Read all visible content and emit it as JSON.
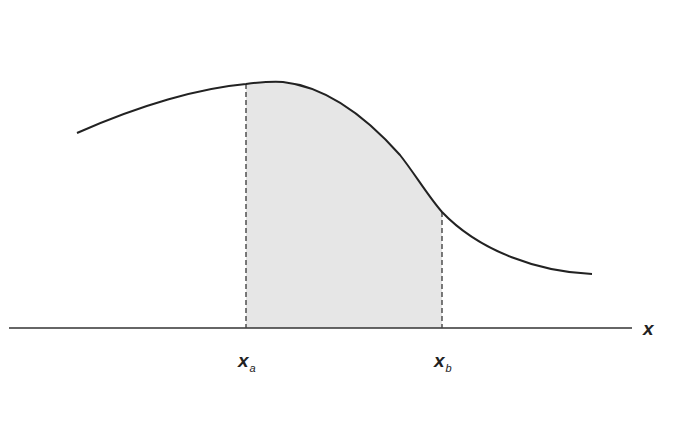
{
  "diagram": {
    "type": "area-under-curve",
    "axis_label": "x",
    "lower_bound": {
      "symbol": "x",
      "subscript": "a"
    },
    "upper_bound": {
      "symbol": "x",
      "subscript": "b"
    },
    "colors": {
      "curve": "#222222",
      "axis": "#333333",
      "fill": "#e6e6e6",
      "bound_lines": "#444444"
    }
  }
}
